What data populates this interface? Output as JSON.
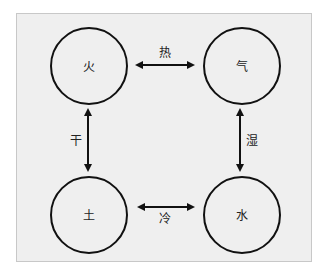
{
  "diagram": {
    "nodes": [
      {
        "id": "fire",
        "label": "火",
        "cx": 89,
        "cy": 66
      },
      {
        "id": "air",
        "label": "气",
        "cx": 242,
        "cy": 66
      },
      {
        "id": "earth",
        "label": "土",
        "cx": 89,
        "cy": 215
      },
      {
        "id": "water",
        "label": "水",
        "cx": 242,
        "cy": 215
      }
    ],
    "edges": [
      {
        "from": "fire",
        "to": "air",
        "label": "热"
      },
      {
        "from": "fire",
        "to": "earth",
        "label": "干"
      },
      {
        "from": "air",
        "to": "water",
        "label": "湿"
      },
      {
        "from": "earth",
        "to": "water",
        "label": "冷"
      }
    ],
    "colors": {
      "background": "#efefef",
      "stroke": "#111111",
      "border": "#c8c8c8"
    }
  }
}
